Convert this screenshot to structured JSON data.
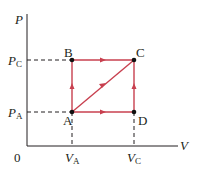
{
  "diagram": {
    "type": "PV diagram",
    "axes": {
      "y_label": "P",
      "x_label": "V",
      "origin_label": "0"
    },
    "y_ticks": [
      {
        "symbol": "P",
        "subscript": "C"
      },
      {
        "symbol": "P",
        "subscript": "A"
      }
    ],
    "x_ticks": [
      {
        "symbol": "V",
        "subscript": "A"
      },
      {
        "symbol": "V",
        "subscript": "C"
      }
    ],
    "points": [
      {
        "name": "A",
        "P": "P_A",
        "V": "V_A"
      },
      {
        "name": "B",
        "P": "P_C",
        "V": "V_A"
      },
      {
        "name": "C",
        "P": "P_C",
        "V": "V_C"
      },
      {
        "name": "D",
        "P": "P_A",
        "V": "V_C"
      }
    ],
    "paths": [
      {
        "from": "A",
        "to": "B",
        "direction": "up"
      },
      {
        "from": "B",
        "to": "C",
        "direction": "right"
      },
      {
        "from": "A",
        "to": "C",
        "direction": "diagonal"
      },
      {
        "from": "A",
        "to": "D",
        "direction": "right"
      },
      {
        "from": "D",
        "to": "C",
        "direction": "up"
      }
    ],
    "colors": {
      "path": "#c8404f",
      "axis": "#231f20",
      "dashed": "#231f20"
    }
  }
}
